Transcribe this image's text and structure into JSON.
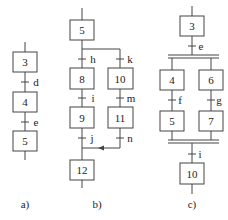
{
  "diagrams": {
    "a": {
      "caption": "a)",
      "steps": [
        "3",
        "4",
        "5"
      ],
      "transitions": [
        "d",
        "e"
      ]
    },
    "b": {
      "caption": "b)",
      "steps": {
        "s5": "5",
        "s8": "8",
        "s9": "9",
        "s10": "10",
        "s11": "11",
        "s12": "12"
      },
      "transitions": {
        "h": "h",
        "i": "i",
        "j": "j",
        "k": "k",
        "m": "m",
        "n": "n"
      }
    },
    "c": {
      "caption": "c)",
      "steps": {
        "s3": "3",
        "s4": "4",
        "s5": "5",
        "s6": "6",
        "s7": "7",
        "s10": "10"
      },
      "transitions": {
        "e": "e",
        "f": "f",
        "g": "g",
        "i": "i"
      }
    }
  },
  "colors": {
    "line": "#444444",
    "background": "#ffffff"
  }
}
